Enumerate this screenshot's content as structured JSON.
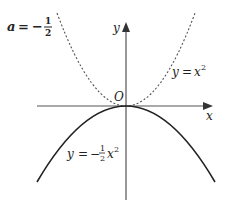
{
  "title_label": {
    "var": "a",
    "eq": "=",
    "sign": "−",
    "num": "1",
    "den": "2"
  },
  "axes": {
    "x_label": "x",
    "y_label": "y",
    "origin_label": "O"
  },
  "curves": [
    {
      "name": "y = x²",
      "style": "dashed",
      "label_lhs": "y",
      "label_eq": "=",
      "label_var": "x",
      "label_exp": "2"
    },
    {
      "name": "y = −½x²",
      "style": "solid",
      "label_lhs": "y",
      "label_eq": "=",
      "label_sign": "−",
      "label_num": "1",
      "label_den": "2",
      "label_var": "x",
      "label_exp": "2"
    }
  ],
  "colors": {
    "axis": "#555555",
    "curve": "#222222",
    "dashed": "#555555"
  }
}
